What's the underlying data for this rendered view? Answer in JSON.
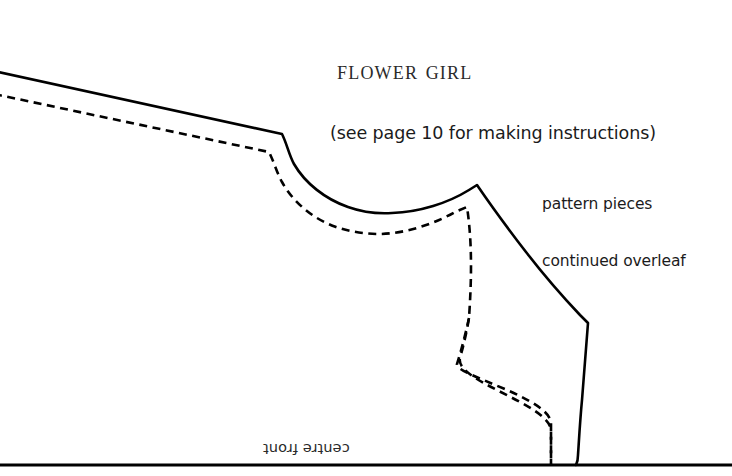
{
  "page": {
    "background_color": "#ffffff",
    "ink_color": "#000000",
    "width": 732,
    "height": 476
  },
  "header": {
    "title": "Flower Girl",
    "subtitle": "(see page 10 for making instructions)"
  },
  "notes": {
    "overleaf_line1": "pattern pieces",
    "overleaf_line2": "continued overleaf"
  },
  "pattern": {
    "centre_front_label": "centre front",
    "cutting_line_name": "cutting-line",
    "stitching_line_name": "stitching-line",
    "foldline_name": "centre-front-foldline",
    "stroke_width": 2.6,
    "dash_pattern": "8 5.5",
    "cutting_line_path": "M -6 71 L 283 135 C 289 147 291 160 297 168 C 318 197 352 212 390 212 C 424 212 455 203 477 186 C 503 220 530 258 557 290 C 567 302 578 313 587 323 C 584 360 581 404 578 452 C 578 458 577 462 576 465",
    "stitching_line_path": "M -6 94 L 270 152 C 276 165 278 176 284 185 C 304 216 342 233 381 233 C 414 233 446 224 467 208 C 470 237 470 267 470 290 C 470 303 471 313 472 323 C 466 357 460 400 554 452 L 554 465",
    "foldline_path": "M -4 465 L 732 465",
    "armhole_note": "outer cutting line with inner dashed stitching line"
  }
}
